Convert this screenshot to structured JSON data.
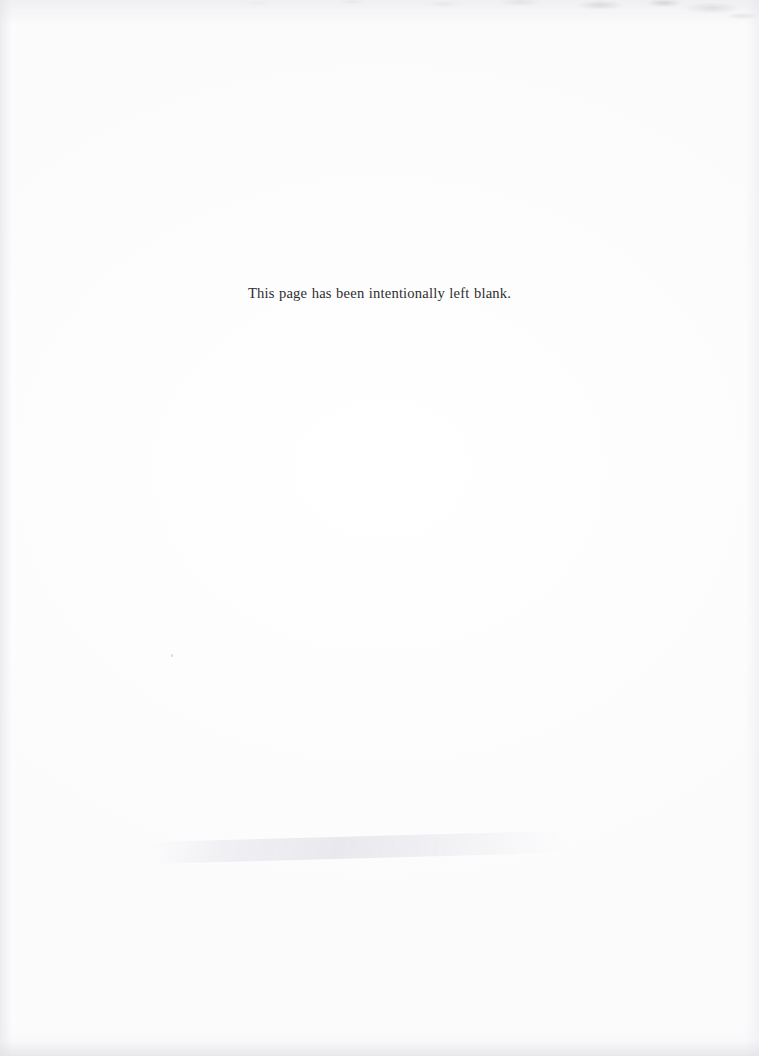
{
  "document": {
    "type": "scanned-page",
    "page_width": 759,
    "page_height": 1056,
    "background_color": "#ffffff",
    "ink_color": "#2e2e2e"
  },
  "body": {
    "notice": "This page has been intentionally left blank."
  },
  "artifacts": {
    "top_noise_label": "scan noise band",
    "bottom_noise_label": "scan speckle band",
    "left_edge_label": "left edge shadow",
    "right_edge_label": "right edge shadow",
    "fold_streak_label": "paper fold streak",
    "speck_label": "dust speck"
  }
}
